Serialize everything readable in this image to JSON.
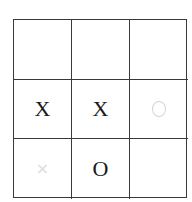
{
  "board": {
    "rows": 3,
    "cols": 3,
    "cells": [
      {
        "row": 0,
        "col": 0,
        "mark": "",
        "state": "empty"
      },
      {
        "row": 0,
        "col": 1,
        "mark": "",
        "state": "empty"
      },
      {
        "row": 0,
        "col": 2,
        "mark": "",
        "state": "empty"
      },
      {
        "row": 1,
        "col": 0,
        "mark": "X",
        "state": "placed"
      },
      {
        "row": 1,
        "col": 1,
        "mark": "X",
        "state": "placed"
      },
      {
        "row": 1,
        "col": 2,
        "mark": "O",
        "state": "hint"
      },
      {
        "row": 2,
        "col": 0,
        "mark": "×",
        "state": "hint"
      },
      {
        "row": 2,
        "col": 1,
        "mark": "O",
        "state": "placed"
      },
      {
        "row": 2,
        "col": 2,
        "mark": "",
        "state": "empty"
      }
    ]
  },
  "colors": {
    "grid_line": "#3a3a3a",
    "mark": "#1a1a1a",
    "hint_mark": "#d4d4d4",
    "background": "#ffffff"
  }
}
